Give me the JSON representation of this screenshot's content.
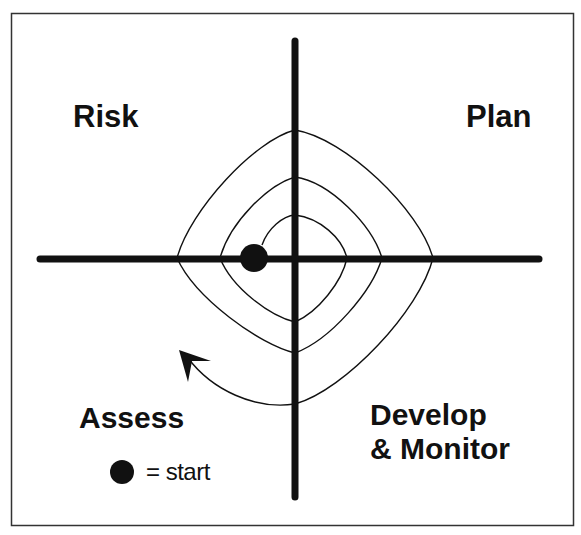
{
  "diagram": {
    "type": "spiral-quadrant-diagram",
    "quadrants": {
      "top_left": "Risk",
      "top_right": "Plan",
      "bottom_left": "Assess",
      "bottom_right_line1": "Develop",
      "bottom_right_line2": "& Monitor"
    },
    "legend": {
      "symbol": "filled-circle",
      "text": "= start"
    },
    "spiral": {
      "loops": 3,
      "direction": "clockwise-outward",
      "start_marker": "filled-circle",
      "end_marker": "arrowhead"
    },
    "colors": {
      "ink": "#111111",
      "background": "#ffffff",
      "frame": "#333333"
    }
  }
}
